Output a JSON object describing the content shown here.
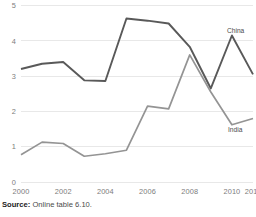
{
  "source_note": {
    "label": "Source:",
    "text": "Online table 6.10."
  },
  "chart_data": {
    "type": "line",
    "title": "",
    "subtitle": "",
    "xlabel": "",
    "ylabel": "",
    "x": [
      2000,
      2001,
      2002,
      2003,
      2004,
      2005,
      2006,
      2007,
      2008,
      2009,
      2010,
      2011
    ],
    "xtick_labels": [
      "2000",
      "2002",
      "2004",
      "2006",
      "2008",
      "2010",
      "2011"
    ],
    "xtick_values": [
      2000,
      2002,
      2004,
      2006,
      2008,
      2010,
      2011
    ],
    "ytick_labels": [
      "0",
      "1",
      "2",
      "3",
      "4",
      "5"
    ],
    "ytick_values": [
      0,
      1,
      2,
      3,
      4,
      5
    ],
    "ylim": [
      0,
      5
    ],
    "xlim": [
      2000,
      2011
    ],
    "grid": "horizontal",
    "legend_position": "inline-right",
    "series": [
      {
        "name": "China",
        "color": "#595959",
        "line_width": 1.9,
        "label": "China",
        "values": [
          3.2,
          3.35,
          3.4,
          2.88,
          2.86,
          4.63,
          4.57,
          4.49,
          3.83,
          2.65,
          4.15,
          3.05
        ]
      },
      {
        "name": "India",
        "color": "#949494",
        "line_width": 1.7,
        "label": "India",
        "values": [
          0.77,
          1.13,
          1.09,
          0.73,
          0.8,
          0.9,
          2.15,
          2.07,
          3.6,
          2.55,
          1.62,
          1.8
        ]
      }
    ]
  }
}
